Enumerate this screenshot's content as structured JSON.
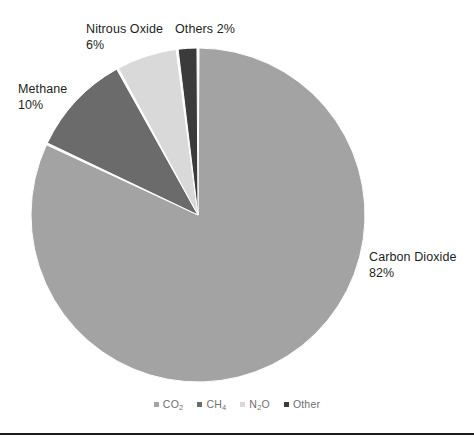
{
  "chart_data": {
    "type": "pie",
    "title": "",
    "categories": [
      "Carbon Dioxide",
      "Methane",
      "Nitrous Oxide",
      "Others"
    ],
    "values": [
      82,
      10,
      6,
      2
    ],
    "unit": "%",
    "legend_position": "bottom",
    "start_angle_deg": 0,
    "direction": "clockwise",
    "colors": [
      "#A3A3A3",
      "#6B6B6B",
      "#D9D9D9",
      "#3B3B3B"
    ],
    "slices": [
      {
        "name": "Carbon Dioxide",
        "value": 82,
        "label": "Carbon Dioxide",
        "pct_label": "82%",
        "color": "#A3A3A3",
        "legend_key": "CO2"
      },
      {
        "name": "Methane",
        "value": 10,
        "label": "Methane",
        "pct_label": "10%",
        "color": "#6B6B6B",
        "legend_key": "CH4"
      },
      {
        "name": "Nitrous Oxide",
        "value": 6,
        "label": "Nitrous Oxide",
        "pct_label": "6%",
        "color": "#D9D9D9",
        "legend_key": "N2O"
      },
      {
        "name": "Others",
        "value": 2,
        "label": "Others",
        "pct_label": "2%",
        "color": "#3B3B3B",
        "legend_key": "Other"
      }
    ],
    "legend": [
      {
        "marker_color": "#A3A3A3",
        "text": "CO2",
        "base": "CO",
        "sub": "2"
      },
      {
        "marker_color": "#6B6B6B",
        "text": "CH4",
        "base": "CH",
        "sub": "4"
      },
      {
        "marker_color": "#D9D9D9",
        "text": "N2O",
        "base": "N",
        "sub": "2",
        "tail": "O"
      },
      {
        "marker_color": "#3B3B3B",
        "text": "Other",
        "base": "Other",
        "sub": ""
      }
    ]
  },
  "callouts": {
    "methane": {
      "name": "Methane",
      "pct": "10%"
    },
    "nitrous": {
      "name": "Nitrous Oxide",
      "pct": "6%"
    },
    "others": {
      "name": "Others 2%"
    },
    "carbon_dioxide": {
      "name": "Carbon Dioxide",
      "pct": "82%"
    }
  },
  "geometry": {
    "center_x": 198,
    "center_y": 215,
    "radius": 167
  }
}
